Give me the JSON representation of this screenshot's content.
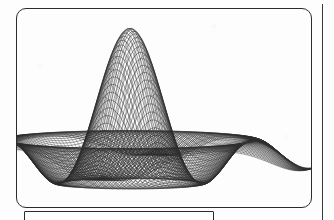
{
  "document": {
    "page_background": "#fdfdfd",
    "ink_color": "#111111"
  },
  "figure": {
    "name": "wireframe-surface-figure",
    "frame": {
      "shape": "rounded-rectangle",
      "x": 16,
      "y": 8,
      "width": 296,
      "height": 200,
      "border_color": "#2b2b2b",
      "corner_radius": 10
    }
  },
  "caption_box": {
    "name": "caption-frame",
    "shape": "rectangle",
    "x": 24,
    "y": 211,
    "width": 190,
    "height": 26,
    "border_color": "#2b2b2b",
    "text": ""
  },
  "page_rule": {
    "name": "right-margin-rule",
    "x": 322,
    "y": 4,
    "height": 216,
    "color": "#3a3a3a"
  },
  "chart_data": {
    "type": "line",
    "title": "",
    "subtitle": "",
    "xlabel": "",
    "ylabel": "",
    "render_style": "3d-wireframe-mesh",
    "grid": false,
    "legend": null,
    "axes_visible": false,
    "tick_labels": [],
    "annotations": [],
    "apex": {
      "x": 130,
      "y": 28
    },
    "view": {
      "azimuth_deg": -37,
      "elevation_deg": 22
    },
    "line_count": 120,
    "surface_function": "z = sin(r)/r  (sinc / damped radial wave)",
    "domain": {
      "u_min": -8.5,
      "u_max": 8.5,
      "v_min": -8.5,
      "v_max": 8.5
    },
    "zlim": [
      -0.25,
      1.0
    ],
    "lobes": [
      {
        "index": 0,
        "trough_x": 52,
        "trough_y": 176,
        "ridge_height": 0.18
      },
      {
        "index": 1,
        "trough_x": 106,
        "trough_y": 186,
        "ridge_height": 0.26
      },
      {
        "index": 2,
        "trough_x": 160,
        "trough_y": 186,
        "ridge_height": 0.26
      },
      {
        "index": 3,
        "trough_x": 214,
        "trough_y": 181,
        "ridge_height": 0.22
      },
      {
        "index": 4,
        "trough_x": 262,
        "trough_y": 172,
        "ridge_height": 0.18
      }
    ],
    "left_tail": {
      "x": 23,
      "y": 148
    },
    "right_tail": {
      "x": 305,
      "y": 170
    },
    "series": [
      {
        "name": "mesh-fan-left",
        "values": [
          0.0,
          0.12,
          0.31,
          0.55,
          0.78,
          0.94,
          1.0,
          0.92,
          0.7,
          0.41,
          0.13,
          -0.08,
          -0.18,
          -0.16,
          -0.06,
          0.05,
          0.12,
          0.13,
          0.08,
          0.01
        ]
      },
      {
        "name": "mesh-fan-right",
        "values": [
          0.0,
          0.1,
          0.27,
          0.5,
          0.74,
          0.92,
          1.0,
          0.93,
          0.72,
          0.44,
          0.16,
          -0.05,
          -0.16,
          -0.15,
          -0.05,
          0.06,
          0.12,
          0.12,
          0.07,
          0.0
        ]
      }
    ],
    "x": [
      -8.5,
      -7.6,
      -6.7,
      -5.8,
      -4.9,
      -4.0,
      -3.1,
      -2.2,
      -1.3,
      -0.4,
      0.5,
      1.4,
      2.3,
      3.2,
      4.1,
      5.0,
      5.9,
      6.8,
      7.7,
      8.5
    ]
  }
}
